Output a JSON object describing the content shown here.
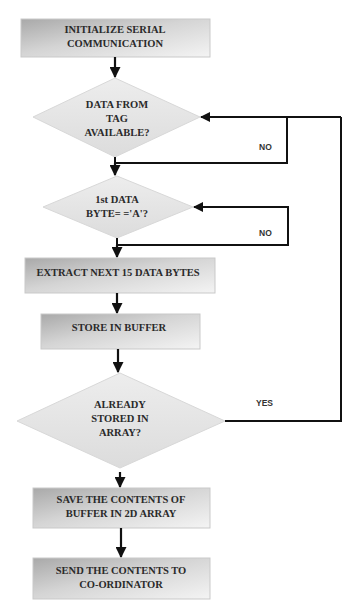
{
  "flowchart": {
    "colors": {
      "box_fill_dark": "#b8b8b8",
      "box_fill_light": "#f2f2f2",
      "diamond_fill": "#e6e6e6",
      "line": "#111111",
      "text": "#2a2a2a"
    },
    "nodes": [
      {
        "id": "init",
        "type": "process",
        "lines": [
          "INITIALIZE SERIAL",
          "COMMUNICATION"
        ]
      },
      {
        "id": "data_available",
        "type": "decision",
        "lines": [
          "DATA FROM",
          "TAG",
          "AVAILABLE?"
        ]
      },
      {
        "id": "first_byte",
        "type": "decision",
        "lines": [
          "1st DATA",
          "BYTE= ='A'?"
        ]
      },
      {
        "id": "extract",
        "type": "process",
        "lines": [
          "EXTRACT NEXT 15 DATA BYTES"
        ]
      },
      {
        "id": "store_buffer",
        "type": "process",
        "lines": [
          "STORE IN BUFFER"
        ]
      },
      {
        "id": "already_stored",
        "type": "decision",
        "lines": [
          "ALREADY",
          "STORED IN",
          "ARRAY?"
        ]
      },
      {
        "id": "save_array",
        "type": "process",
        "lines": [
          "SAVE THE CONTENTS OF",
          "BUFFER IN 2D ARRAY"
        ]
      },
      {
        "id": "send",
        "type": "process",
        "lines": [
          "SEND THE CONTENTS TO",
          "CO-ORDINATOR"
        ]
      }
    ],
    "edge_labels": {
      "no_1": "NO",
      "no_2": "NO",
      "yes": "YES"
    }
  }
}
